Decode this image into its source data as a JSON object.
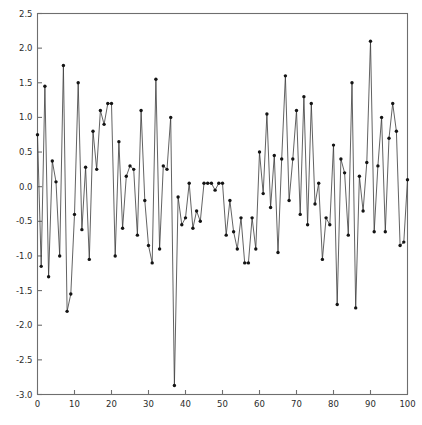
{
  "chart_data": {
    "type": "line",
    "title": "",
    "subtitle": "",
    "xlabel": "",
    "ylabel": "",
    "xlim": [
      0,
      100
    ],
    "ylim": [
      -3.0,
      2.5
    ],
    "grid": false,
    "legend": null,
    "legend_position": "none",
    "marker": "filled-circle",
    "line_color": "#3a3a3a",
    "marker_color": "#141414",
    "axis_color": "#6e6e6e",
    "background_color": "#ffffff",
    "frame": "box",
    "tick_direction": "in",
    "xticks": [
      0,
      10,
      20,
      30,
      40,
      50,
      60,
      70,
      80,
      90,
      100
    ],
    "xtick_labels": [
      "0",
      "10",
      "20",
      "30",
      "40",
      "50",
      "60",
      "70",
      "80",
      "90",
      "100"
    ],
    "yticks": [
      -3.0,
      -2.5,
      -2.0,
      -1.5,
      -1.0,
      -0.5,
      0.0,
      0.5,
      1.0,
      1.5,
      2.0,
      2.5
    ],
    "ytick_labels": [
      "-3.0",
      "-2.5",
      "-2.0",
      "-1.5",
      "-1.0",
      "-0.5",
      "0.0",
      "0.5",
      "1.0",
      "1.5",
      "2.0",
      "2.5"
    ],
    "x": [
      0,
      1,
      2,
      3,
      4,
      5,
      6,
      7,
      8,
      9,
      10,
      11,
      12,
      13,
      14,
      15,
      16,
      17,
      18,
      19,
      20,
      21,
      22,
      23,
      24,
      25,
      26,
      27,
      28,
      29,
      30,
      31,
      32,
      33,
      34,
      35,
      36,
      37,
      38,
      39,
      40,
      41,
      42,
      43,
      44,
      45,
      46,
      47,
      48,
      49,
      50,
      51,
      52,
      53,
      54,
      55,
      56,
      57,
      58,
      59,
      60,
      61,
      62,
      63,
      64,
      65,
      66,
      67,
      68,
      69,
      70,
      71,
      72,
      73,
      74,
      75,
      76,
      77,
      78,
      79,
      80,
      81,
      82,
      83,
      84,
      85,
      86,
      87,
      88,
      89,
      90,
      91,
      92,
      93,
      94,
      95,
      96,
      97,
      98,
      99,
      100
    ],
    "values": [
      0.75,
      -1.15,
      1.45,
      -1.3,
      0.37,
      0.07,
      -1.0,
      1.75,
      -1.8,
      -1.55,
      -0.4,
      1.5,
      -0.62,
      0.28,
      -1.05,
      0.8,
      0.25,
      1.1,
      0.9,
      1.2,
      1.2,
      -1.0,
      0.65,
      -0.6,
      0.15,
      0.3,
      0.25,
      -0.7,
      1.1,
      -0.2,
      -0.85,
      -1.1,
      1.55,
      -0.9,
      0.3,
      0.25,
      1.0,
      -2.87,
      -0.15,
      -0.55,
      -0.45,
      0.05,
      -0.6,
      -0.35,
      -0.5,
      0.05,
      0.05,
      0.05,
      -0.05,
      0.05,
      0.05,
      -0.7,
      -0.2,
      -0.65,
      -0.9,
      -0.45,
      -1.1,
      -1.1,
      -0.45,
      -0.9,
      0.5,
      -0.1,
      1.05,
      -0.3,
      0.45,
      -0.95,
      0.4,
      1.6,
      -0.2,
      0.4,
      1.1,
      -0.4,
      1.3,
      -0.55,
      1.2,
      -0.25,
      0.05,
      -1.05,
      -0.45,
      -0.55,
      0.6,
      -1.7,
      0.4,
      0.2,
      -0.7,
      1.5,
      -1.75,
      0.15,
      -0.35,
      0.35,
      2.1,
      -0.65,
      0.3,
      1.0,
      -0.65,
      0.7,
      1.2,
      0.8,
      -0.85,
      -0.8,
      0.1
    ]
  }
}
